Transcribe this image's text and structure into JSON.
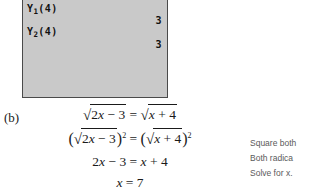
{
  "calculator": {
    "screen": {
      "background_color": "#c9c9c9",
      "border_color": "#4a4a4a",
      "rows": [
        {
          "expression_base": "Y",
          "expression_sub": "1",
          "expression_tail": "(4)",
          "result": "3"
        },
        {
          "expression_base": "Y",
          "expression_sub": "2",
          "expression_tail": "(4)",
          "result": "3"
        }
      ]
    }
  },
  "solution": {
    "part_label": "(b)",
    "equations": [
      {
        "id": "line-1",
        "plain": "√(2x − 3) = √(x + 4)",
        "left_radicand_coef": "2",
        "left_radicand_var": "x",
        "left_radicand_rest": " − 3",
        "relation": "=",
        "right_radicand_var": "x",
        "right_radicand_rest": " + 4"
      },
      {
        "id": "line-2",
        "plain": "(√(2x − 3))² = (√(x + 4))²",
        "open_paren": "(",
        "close_paren": ")",
        "exponent": "2"
      },
      {
        "id": "line-3",
        "plain": "2x − 3 = x + 4",
        "lhs_coef": "2",
        "lhs_var": "x",
        "lhs_rest": " − 3",
        "relation": "=",
        "rhs_var": "x",
        "rhs_rest": " + 4"
      },
      {
        "id": "line-4",
        "plain": "x = 7",
        "lhs_var": "x",
        "relation": "=",
        "rhs": "7"
      }
    ]
  },
  "annotations": {
    "note_color": "#5a5a5a",
    "items": [
      {
        "text": "Square both",
        "truncated": true
      },
      {
        "text": "Both radica",
        "truncated": true
      },
      {
        "text": "Solve for x.",
        "truncated": false
      }
    ]
  },
  "symbols": {
    "surd": "√",
    "minus": "−",
    "plus": "+",
    "equals": "="
  }
}
